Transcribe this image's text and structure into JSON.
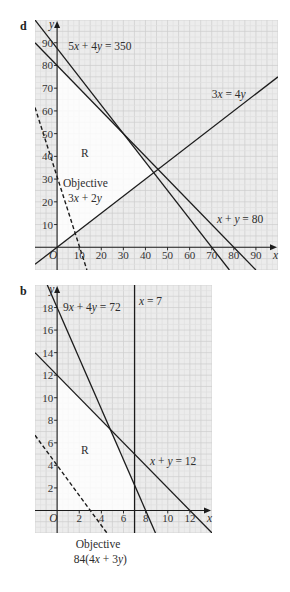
{
  "colors": {
    "page": "#ffffff",
    "background": "#ececec",
    "grid": "#cdcdcd",
    "grid_minor": "#e0e0e0",
    "region_fill": "#ffffff",
    "line": "#1c1c1c",
    "axis": "#1c1c1c",
    "text": "#2e2e2e"
  },
  "chart_data": [
    {
      "panel_label": "d",
      "type": "line",
      "title": "",
      "xlabel": "x",
      "ylabel": "y",
      "origin_label": "O",
      "xlim": [
        -10,
        100
      ],
      "ylim": [
        -10,
        100
      ],
      "grid": true,
      "grid_step": 5,
      "xticks": [
        10,
        20,
        30,
        40,
        50,
        60,
        70,
        80,
        90
      ],
      "yticks": [
        10,
        20,
        30,
        40,
        50,
        60,
        70,
        80,
        90
      ],
      "series": [
        {
          "name": "5x + 4y = 350",
          "style": "solid",
          "points": [
            [
              -10,
              100
            ],
            [
              78,
              -10
            ]
          ]
        },
        {
          "name": "x + y = 80",
          "style": "solid",
          "points": [
            [
              -10,
              90
            ],
            [
              90,
              -10
            ]
          ]
        },
        {
          "name": "3x = 4y",
          "style": "solid",
          "points": [
            [
              -10,
              -7.5
            ],
            [
              100,
              75
            ]
          ]
        },
        {
          "name": "Objective 3x + 2y",
          "style": "dashed",
          "points": [
            [
              -10,
              61.5
            ],
            [
              13.5,
              -10
            ]
          ]
        }
      ],
      "feasible_region": {
        "label": "R",
        "vertices": [
          [
            0,
            0
          ],
          [
            0,
            80
          ],
          [
            30,
            50
          ],
          [
            43.75,
            32.8125
          ]
        ]
      },
      "annotations": [
        {
          "text": "5x + 4y = 350",
          "x": 5,
          "y": 86.8,
          "anchor": "start"
        },
        {
          "text": "3x = 4y",
          "x": 70,
          "y": 65.7,
          "anchor": "start"
        },
        {
          "text": "R",
          "x": 10.8,
          "y": 39.7,
          "anchor": "start"
        },
        {
          "text": "Objective",
          "x": 2.7,
          "y": 26.5,
          "anchor": "start"
        },
        {
          "text": "3x + 2y",
          "x": 4.9,
          "y": 19.9,
          "anchor": "start"
        },
        {
          "text": "x + y = 80",
          "x": 72.4,
          "y": 10.7,
          "anchor": "start"
        }
      ]
    },
    {
      "panel_label": "b",
      "type": "line",
      "title": "",
      "xlabel": "x",
      "ylabel": "y",
      "origin_label": "O",
      "xlim": [
        -2,
        14
      ],
      "ylim": [
        -2,
        20
      ],
      "grid": true,
      "grid_step": 1,
      "xticks": [
        2,
        4,
        6,
        8,
        10,
        12
      ],
      "yticks": [
        2,
        4,
        6,
        8,
        10,
        12,
        14,
        16,
        18
      ],
      "series": [
        {
          "name": "9x + 4y = 72",
          "style": "solid",
          "points": [
            [
              -0.89,
              20
            ],
            [
              8.89,
              -2
            ]
          ]
        },
        {
          "name": "x + y = 12",
          "style": "solid",
          "points": [
            [
              -2,
              14
            ],
            [
              14,
              -2
            ]
          ]
        },
        {
          "name": "x = 7",
          "style": "solid",
          "points": [
            [
              7,
              20
            ],
            [
              7,
              -2
            ]
          ]
        },
        {
          "name": "Objective 84(4x + 3y)",
          "style": "dashed",
          "points": [
            [
              -2,
              6.67
            ],
            [
              4.5,
              -2
            ]
          ]
        }
      ],
      "feasible_region": {
        "label": "R",
        "vertices": [
          [
            0,
            0
          ],
          [
            0,
            12
          ],
          [
            4.8,
            7.2
          ],
          [
            7,
            2.25
          ],
          [
            7,
            0
          ]
        ]
      },
      "annotations": [
        {
          "text": "9x + 4y = 72",
          "x": 0.53,
          "y": 17.7,
          "anchor": "start"
        },
        {
          "text": "x = 7",
          "x": 7.4,
          "y": 18.2,
          "anchor": "start"
        },
        {
          "text": "R",
          "x": 2.16,
          "y": 5.0,
          "anchor": "start"
        },
        {
          "text": "x + y = 12",
          "x": 8.4,
          "y": 4.0,
          "anchor": "start"
        },
        {
          "text": "Objective",
          "x": 3.7,
          "y": -3.33,
          "anchor": "middle"
        },
        {
          "text": "84(4x + 3y)",
          "x": 3.9,
          "y": -4.66,
          "anchor": "middle"
        }
      ]
    }
  ]
}
